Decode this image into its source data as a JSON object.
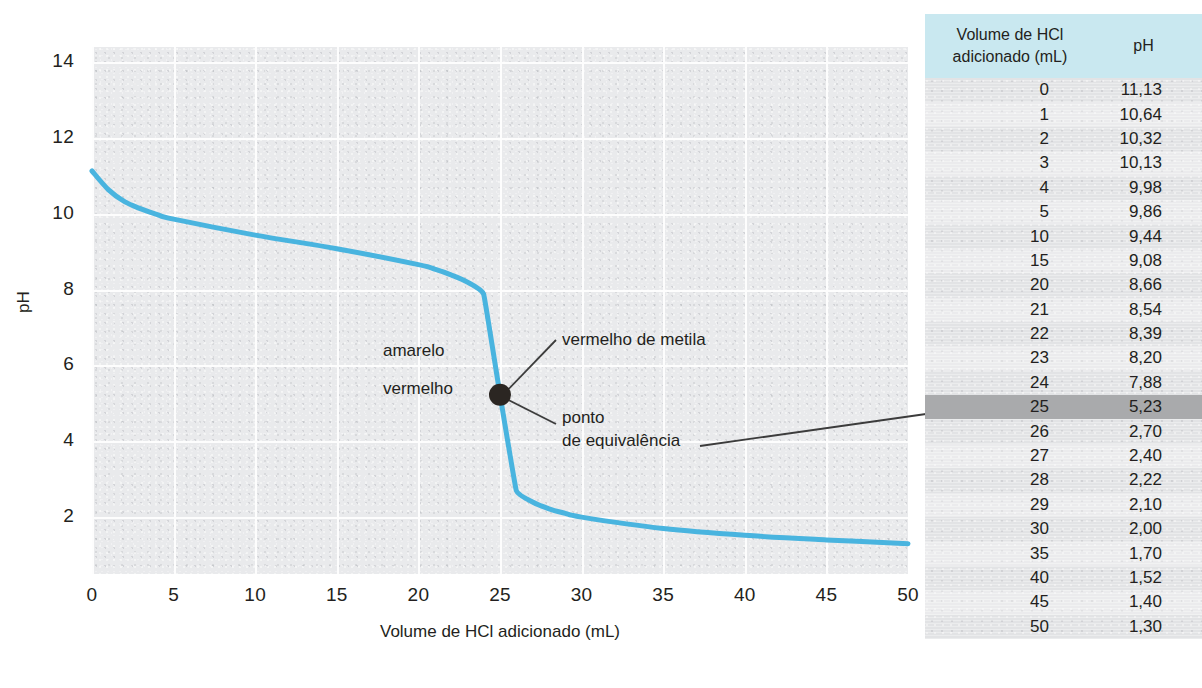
{
  "chart_data": {
    "type": "line",
    "title": "",
    "xlabel": "Volume de HCl adicionado (mL)",
    "ylabel": "pH",
    "xlim": [
      0,
      50
    ],
    "ylim": [
      0.5,
      14.4
    ],
    "xticks": [
      "0",
      "5",
      "10",
      "15",
      "20",
      "25",
      "30",
      "35",
      "40",
      "45",
      "50"
    ],
    "yticks": [
      "14",
      "12",
      "10",
      "8",
      "6",
      "4",
      "2"
    ],
    "grid": true,
    "legend": "none",
    "series_name": "Curva de titulação NH3 com HCl",
    "line_color": "#49b4df",
    "x": [
      0,
      1,
      2,
      3,
      4,
      5,
      10,
      15,
      20,
      21,
      22,
      23,
      24,
      25,
      26,
      27,
      28,
      29,
      30,
      35,
      40,
      45,
      50
    ],
    "values": [
      11.13,
      10.64,
      10.32,
      10.13,
      9.98,
      9.86,
      9.44,
      9.08,
      8.66,
      8.54,
      8.39,
      8.2,
      7.88,
      5.23,
      2.7,
      2.4,
      2.22,
      2.1,
      2.0,
      1.7,
      1.52,
      1.4,
      1.3
    ],
    "equivalence_point": {
      "x": 25,
      "y": 5.23
    },
    "annotations": [
      {
        "text": "amarelo",
        "x": 18.5,
        "y": 6.4
      },
      {
        "text": "vermelho",
        "x": 18.5,
        "y": 5.35
      },
      {
        "text": "vermelho de metila",
        "x": 29.5,
        "y": 6.7
      },
      {
        "text": "ponto",
        "x": 29.5,
        "y": 4.55
      },
      {
        "text": "de equivalência",
        "x": 29.5,
        "y": 3.95
      }
    ]
  },
  "axis": {
    "ylabel": "pH",
    "xlabel": "Volume de HCl adicionado (mL)",
    "yticks": [
      "14",
      "12",
      "10",
      "8",
      "6",
      "4",
      "2"
    ],
    "xticks": [
      "0",
      "5",
      "10",
      "15",
      "20",
      "25",
      "30",
      "35",
      "40",
      "45",
      "50"
    ]
  },
  "annotations": {
    "amarelo": "amarelo",
    "vermelho": "vermelho",
    "metila": "vermelho de metila",
    "ponto_l1": "ponto",
    "ponto_l2": "de equivalência"
  },
  "table": {
    "header": {
      "volume_l1": "Volume de HCl",
      "volume_l2": "adicionado (mL)",
      "ph": "pH"
    },
    "highlight_row_index": 13,
    "rows": [
      {
        "volume": "0",
        "ph": "11,13"
      },
      {
        "volume": "1",
        "ph": "10,64"
      },
      {
        "volume": "2",
        "ph": "10,32"
      },
      {
        "volume": "3",
        "ph": "10,13"
      },
      {
        "volume": "4",
        "ph": "9,98"
      },
      {
        "volume": "5",
        "ph": "9,86"
      },
      {
        "volume": "10",
        "ph": "9,44"
      },
      {
        "volume": "15",
        "ph": "9,08"
      },
      {
        "volume": "20",
        "ph": "8,66"
      },
      {
        "volume": "21",
        "ph": "8,54"
      },
      {
        "volume": "22",
        "ph": "8,39"
      },
      {
        "volume": "23",
        "ph": "8,20"
      },
      {
        "volume": "24",
        "ph": "7,88"
      },
      {
        "volume": "25",
        "ph": "5,23"
      },
      {
        "volume": "26",
        "ph": "2,70"
      },
      {
        "volume": "27",
        "ph": "2,40"
      },
      {
        "volume": "28",
        "ph": "2,22"
      },
      {
        "volume": "29",
        "ph": "2,10"
      },
      {
        "volume": "30",
        "ph": "2,00"
      },
      {
        "volume": "35",
        "ph": "1,70"
      },
      {
        "volume": "40",
        "ph": "1,52"
      },
      {
        "volume": "45",
        "ph": "1,40"
      },
      {
        "volume": "50",
        "ph": "1,30"
      }
    ]
  },
  "colors": {
    "curve": "#49b4df",
    "plot_background": "#e9eaec",
    "gridline": "#fdfdfd",
    "table_header": "#c9e8f0",
    "table_background": "#e2e3e5",
    "highlight": "#a9aaac",
    "equivalence_dot": "#2b2622",
    "leader_line": "#3c3c3c"
  }
}
